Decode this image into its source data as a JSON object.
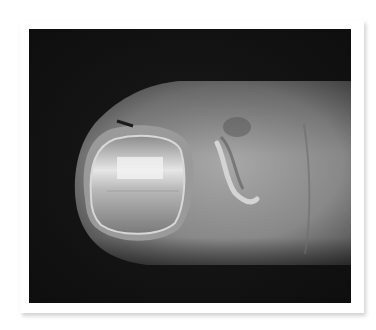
{
  "image": {
    "subject": "thumb-fingertip-closeup",
    "frame_color": "#ffffff",
    "background_color": "#121212",
    "skin_tone": "#8a8a8a"
  }
}
